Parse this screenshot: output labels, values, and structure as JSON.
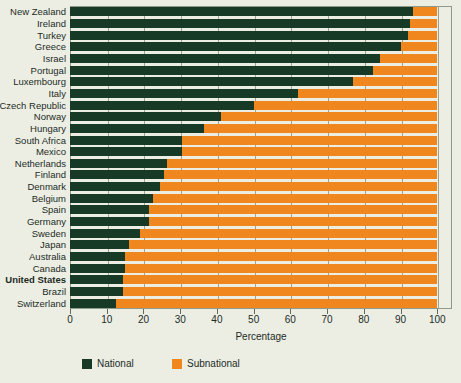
{
  "chart_data": {
    "type": "bar",
    "subtype": "stacked-horizontal-100pct",
    "title": "",
    "xlabel": "Percentage",
    "ylabel": "",
    "xlim": [
      0,
      104
    ],
    "xticks": [
      0,
      10,
      20,
      30,
      40,
      50,
      60,
      70,
      80,
      90,
      100
    ],
    "xtick_labels": [
      "0",
      "10",
      "20",
      "30",
      "40",
      "50",
      "60",
      "70",
      "80",
      "90",
      "100"
    ],
    "grid": true,
    "legend_position": "bottom-left",
    "categories": [
      "New Zealand",
      "Ireland",
      "Turkey",
      "Greece",
      "Israel",
      "Portugal",
      "Luxembourg",
      "Italy",
      "Czech Republic",
      "Norway",
      "Hungary",
      "South Africa",
      "Mexico",
      "Netherlands",
      "Finland",
      "Denmark",
      "Belgium",
      "Spain",
      "Germany",
      "Sweden",
      "Japan",
      "Australia",
      "Canada",
      "United States",
      "Brazil",
      "Switzerland"
    ],
    "highlighted_categories": [
      "United States"
    ],
    "series": [
      {
        "name": "National",
        "color": "#173a27",
        "values": [
          93.5,
          92.5,
          92.0,
          90.0,
          84.5,
          82.5,
          77.0,
          62.0,
          50.0,
          41.0,
          36.5,
          30.5,
          30.5,
          26.5,
          25.5,
          24.5,
          22.5,
          21.5,
          21.5,
          19.0,
          16.0,
          15.0,
          15.0,
          14.5,
          14.5,
          12.5
        ]
      },
      {
        "name": "Subnational",
        "color": "#f0861e",
        "values": [
          6.5,
          7.5,
          8.0,
          10.0,
          15.5,
          17.5,
          23.0,
          38.0,
          50.0,
          59.0,
          63.5,
          69.5,
          69.5,
          73.5,
          74.5,
          75.5,
          77.5,
          78.5,
          78.5,
          81.0,
          84.0,
          85.0,
          85.0,
          85.5,
          85.5,
          87.5
        ]
      }
    ]
  },
  "legend": {
    "items": [
      {
        "label": "National",
        "color": "#173a27"
      },
      {
        "label": "Subnational",
        "color": "#f0861e"
      }
    ]
  },
  "axis": {
    "x_title": "Percentage"
  }
}
